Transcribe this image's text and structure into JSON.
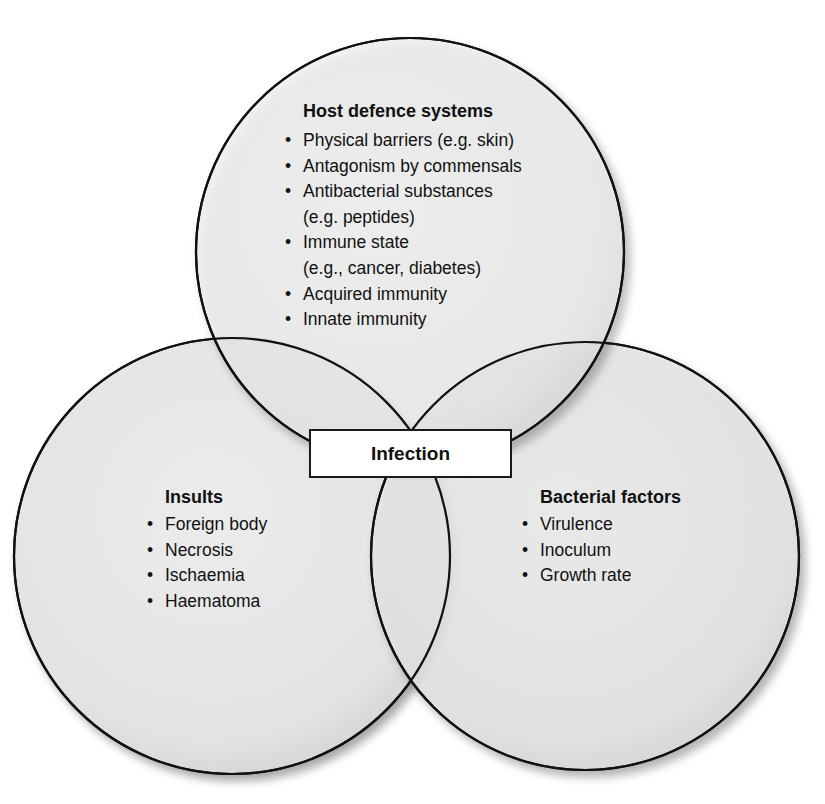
{
  "diagram": {
    "type": "venn",
    "center_label": "Infection",
    "circles": [
      {
        "id": "host",
        "title": "Host defence systems",
        "items": [
          "Physical barriers (e.g. skin)",
          "Antagonism by commensals",
          "Antibacterial substances",
          "(e.g. peptides)",
          "Immune state",
          "(e.g., cancer, diabetes)",
          "Acquired immunity",
          "Innate immunity"
        ],
        "bullet_flags": [
          true,
          true,
          true,
          false,
          true,
          false,
          true,
          true
        ]
      },
      {
        "id": "insults",
        "title": "Insults",
        "items": [
          "Foreign body",
          "Necrosis",
          "Ischaemia",
          "Haematoma"
        ]
      },
      {
        "id": "bacterial",
        "title": "Bacterial factors",
        "items": [
          "Virulence",
          "Inoculum",
          "Growth rate"
        ]
      }
    ],
    "colors": {
      "fill": "#e6e6e6",
      "stroke": "#111111",
      "background": "#ffffff"
    },
    "bullet": "•"
  }
}
